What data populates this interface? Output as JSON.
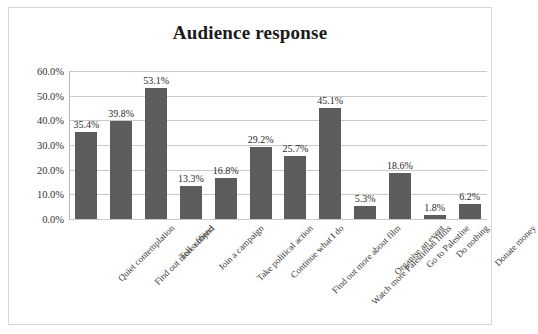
{
  "chart_data": {
    "type": "bar",
    "title": "Audience response",
    "xlabel": "",
    "ylabel": "",
    "ylim": [
      0,
      60
    ],
    "ytick_labels": [
      "60.0%",
      "50.0%",
      "40.0%",
      "30.0%",
      "20.0%",
      "10.0%",
      "0.0%"
    ],
    "ytick_values": [
      60,
      50,
      40,
      30,
      20,
      10,
      0
    ],
    "grid": true,
    "legend": "none",
    "categories": [
      "Quiet contemplation",
      "Find out more subject",
      "Tell a friend",
      "Join a campaign",
      "Take political action",
      "Continue what I do",
      "Find out more about film",
      "Watch more Palestinian films",
      "Organise an event",
      "Go to Palestine",
      "Do nothing",
      "Donate money"
    ],
    "values": [
      35.4,
      39.8,
      53.1,
      13.3,
      16.8,
      29.2,
      25.7,
      45.1,
      5.3,
      18.6,
      1.8,
      6.2
    ],
    "value_labels": [
      "35.4%",
      "39.8%",
      "53.1%",
      "13.3%",
      "16.8%",
      "29.2%",
      "25.7%",
      "45.1%",
      "5.3%",
      "18.6%",
      "1.8%",
      "6.2%"
    ],
    "series_color": "#5c5c5c",
    "gridline_color": "#c9c9c9",
    "frame_color": "#d8d8d8"
  }
}
